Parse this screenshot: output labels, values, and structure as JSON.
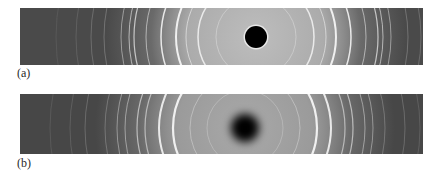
{
  "figure": {
    "panels": [
      {
        "id": "a",
        "label": "(a)",
        "description": "Powder X-ray diffraction pattern strip with sharp central beam stop",
        "center": {
          "x": 236,
          "y": 29
        },
        "beamstop": {
          "radius": 11,
          "blur": 0.6,
          "halo": true
        },
        "center_glow_color": "#bdbdbd",
        "outer_color": "#4a4a4a",
        "rings": [
          {
            "r": 40,
            "w": 1.0,
            "o": 0.35
          },
          {
            "r": 58,
            "w": 1.5,
            "o": 0.85
          },
          {
            "r": 70,
            "w": 1.0,
            "o": 0.6
          },
          {
            "r": 80,
            "w": 2.0,
            "o": 0.95
          },
          {
            "r": 95,
            "w": 1.5,
            "o": 0.9
          },
          {
            "r": 110,
            "w": 1.0,
            "o": 0.55
          },
          {
            "r": 122,
            "w": 1.2,
            "o": 0.7
          },
          {
            "r": 127,
            "w": 1.0,
            "o": 0.6
          },
          {
            "r": 135,
            "w": 1.0,
            "o": 0.45
          },
          {
            "r": 152,
            "w": 0.8,
            "o": 0.3
          },
          {
            "r": 165,
            "w": 0.8,
            "o": 0.25
          },
          {
            "r": 180,
            "w": 0.7,
            "o": 0.18
          },
          {
            "r": 200,
            "w": 0.7,
            "o": 0.12
          }
        ]
      },
      {
        "id": "b",
        "label": "(b)",
        "description": "Powder X-ray diffraction pattern strip with diffuse central spot",
        "center": {
          "x": 225,
          "y": 34
        },
        "beamstop": {
          "radius": 14,
          "blur": 4,
          "halo": false
        },
        "center_glow_color": "#a9a9a9",
        "outer_color": "#474747",
        "rings": [
          {
            "r": 38,
            "w": 1.0,
            "o": 0.25
          },
          {
            "r": 55,
            "w": 1.0,
            "o": 0.35
          },
          {
            "r": 72,
            "w": 2.2,
            "o": 0.95
          },
          {
            "r": 86,
            "w": 2.0,
            "o": 0.9
          },
          {
            "r": 100,
            "w": 1.2,
            "o": 0.55
          },
          {
            "r": 108,
            "w": 1.2,
            "o": 0.6
          },
          {
            "r": 120,
            "w": 1.0,
            "o": 0.45
          },
          {
            "r": 128,
            "w": 1.0,
            "o": 0.4
          },
          {
            "r": 140,
            "w": 0.8,
            "o": 0.3
          },
          {
            "r": 160,
            "w": 0.8,
            "o": 0.25
          },
          {
            "r": 175,
            "w": 0.7,
            "o": 0.2
          },
          {
            "r": 195,
            "w": 0.7,
            "o": 0.15
          }
        ]
      }
    ]
  }
}
